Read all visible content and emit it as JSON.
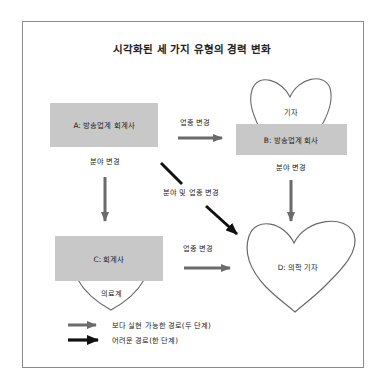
{
  "title": "시각화된 세 가지 유형의 경력 변화",
  "colors": {
    "frame": "#8a8a8a",
    "box_fill": "#c8c8c8",
    "gray_arrow": "#6b6b6b",
    "black_arrow": "#111111",
    "heart_stroke": "#6a6a6a"
  },
  "nodes": {
    "a": {
      "label": "A: 방송업계 회계사"
    },
    "b": {
      "label": "B: 방송업계 회사",
      "heart_label": "기자"
    },
    "c": {
      "label": "C: 회계사",
      "heart_label": "의료계"
    },
    "d": {
      "label": "D: 의학 기자"
    }
  },
  "edges": {
    "a_to_b": {
      "label": "업종 변경",
      "style": "gray"
    },
    "a_to_c": {
      "label": "분야 변경",
      "style": "gray"
    },
    "a_to_d": {
      "label": "분야 및 업종 변경",
      "style": "black"
    },
    "b_to_d": {
      "label": "분야 변경",
      "style": "gray"
    },
    "c_to_d": {
      "label": "업종 변경",
      "style": "gray"
    }
  },
  "legend": [
    {
      "style": "gray",
      "label": "보다 실현 가능한 경로(두 단계)"
    },
    {
      "style": "black",
      "label": "어려운 경로(한 단계)"
    }
  ]
}
